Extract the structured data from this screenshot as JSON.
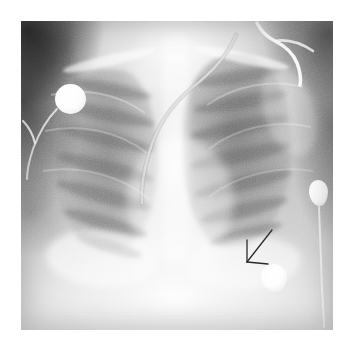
{
  "figure": {
    "modality": "X-ray",
    "view": "AP chest radiograph",
    "caption": "Anteroposterior chest radiograph with arrow annotation",
    "canvas": {
      "width": 352,
      "height": 353
    },
    "plate": {
      "left": 21,
      "top": 21,
      "width": 312,
      "height": 309
    },
    "background_color": "#ffffff"
  },
  "anatomy": {
    "regions": [
      {
        "name": "right-lung-field",
        "label": "Right lung field",
        "aeration": "moderate"
      },
      {
        "name": "left-lung-field",
        "label": "Left lung field",
        "aeration": "increased"
      },
      {
        "name": "mediastinum",
        "label": "Mediastinum",
        "density": "opaque"
      },
      {
        "name": "cardiac-silhouette",
        "label": "Cardiac silhouette",
        "density": "opaque"
      },
      {
        "name": "right-hemidiaphragm",
        "label": "Right hemidiaphragm",
        "density": "opaque"
      },
      {
        "name": "left-hemidiaphragm",
        "label": "Left hemidiaphragm",
        "density": "opaque"
      },
      {
        "name": "right-clavicle",
        "label": "Right clavicle",
        "density": "bone"
      },
      {
        "name": "left-clavicle",
        "label": "Left clavicle",
        "density": "bone"
      },
      {
        "name": "thoracic-spine",
        "label": "Thoracic spine",
        "density": "bone"
      },
      {
        "name": "left-scapula",
        "label": "Left scapula",
        "density": "bone"
      }
    ],
    "rib_bands_right": 7,
    "rib_bands_left": 7
  },
  "hardware": {
    "electrodes": [
      {
        "name": "electrode-upper-right-chest",
        "label": "ECG electrode, upper right chest",
        "shape": "disc",
        "cx": 49,
        "cy": 78,
        "r": 15
      },
      {
        "name": "electrode-left-flank",
        "label": "ECG electrode, left lateral chest",
        "shape": "irregular",
        "cx": 297,
        "cy": 172,
        "r": 12
      },
      {
        "name": "electrode-lower-left-chest",
        "label": "ECG electrode, lower left chest",
        "shape": "irregular",
        "cx": 253,
        "cy": 257,
        "r": 13
      }
    ],
    "lines": [
      {
        "name": "enteric-tube",
        "label": "Enteric tube",
        "course": "mediastinal, curving inferiorly to the left"
      },
      {
        "name": "support-tubing-upper-right",
        "label": "Support tubing at upper left shoulder",
        "course": "entering from superior margin"
      },
      {
        "name": "lead-wire-upper-right-chest",
        "label": "Lead wire from upper right chest electrode"
      },
      {
        "name": "lead-wire-left-flank",
        "label": "Lead wire from left lateral electrode"
      }
    ]
  },
  "annotations": {
    "arrow": {
      "name": "annotation-arrow",
      "label": "Arrow marker",
      "color": "#2b2b2b",
      "stroke_width": 1.3,
      "tail_x": 272,
      "tail_y": 230,
      "tip_x": 247,
      "tip_y": 262,
      "barb_upper_x": 247,
      "barb_upper_y": 240,
      "barb_lower_x": 268,
      "barb_lower_y": 264,
      "points_to": "left lower lung zone / retrocardiac region"
    }
  }
}
